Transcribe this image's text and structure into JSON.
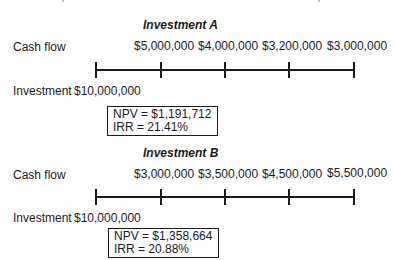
{
  "investment_a": {
    "title": "Investment A",
    "cash_flow_label": "Cash flow",
    "investment_label": "Investment",
    "investment_amount": "$10,000,000",
    "cash_flows": [
      "$5,000,000",
      "$4,000,000",
      "$3,200,000",
      "$3,000,000"
    ],
    "npv": "NPV = $1,191,712",
    "irr": "IRR = 21.41%"
  },
  "investment_b": {
    "title": "Investment B",
    "cash_flow_label": "Cash flow",
    "investment_label": "Investment",
    "investment_amount": "$10,000,000",
    "cash_flows": [
      "$3,000,000",
      "$3,500,000",
      "$4,500,000",
      "$5,500,000"
    ],
    "npv": "NPV = $1,358,664",
    "irr": "IRR = 20.88%"
  },
  "colors": {
    "ink": "#1a1a1a",
    "background": "#ffffff"
  }
}
